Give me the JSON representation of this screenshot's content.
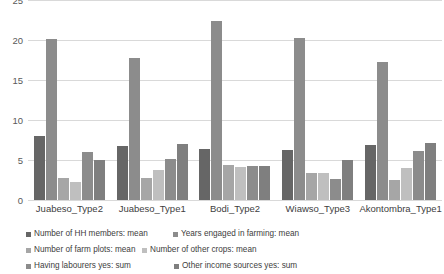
{
  "chart_data": {
    "type": "bar",
    "title": "",
    "subtitle": "",
    "xlabel": "",
    "ylabel": "",
    "ylim": [
      0,
      25
    ],
    "yticks": [
      0,
      5,
      10,
      15,
      20,
      25
    ],
    "grid": true,
    "legend_position": "bottom",
    "categories": [
      "Juabeso_Type2",
      "Juabeso_Type1",
      "Bodi_Type2",
      "Wiawso_Type3",
      "Akontombra_Type1"
    ],
    "series": [
      {
        "name": "Number of HH members: mean",
        "color": "#666666",
        "values": [
          8.0,
          6.8,
          6.4,
          6.2,
          6.9
        ]
      },
      {
        "name": "Years engaged in farming: mean",
        "color": "#8c8c8c",
        "values": [
          20.1,
          17.8,
          22.4,
          20.2,
          17.2
        ]
      },
      {
        "name": "Number of farm plots: mean",
        "color": "#a6a6a6",
        "values": [
          2.8,
          2.7,
          4.4,
          3.4,
          2.5
        ]
      },
      {
        "name": "Number of other crops: mean",
        "color": "#bfbfbf",
        "values": [
          2.3,
          3.7,
          4.1,
          3.4,
          4.0
        ]
      },
      {
        "name": "Having  labourers yes: sum",
        "color": "#8c8c8c",
        "values": [
          6.0,
          5.1,
          4.3,
          2.6,
          6.1
        ]
      },
      {
        "name": "Other income sources yes: sum",
        "color": "#7f7f7f",
        "values": [
          5.0,
          7.0,
          4.3,
          5.0,
          7.1
        ]
      }
    ]
  },
  "axis": {
    "y_tick_labels": [
      "0",
      "5",
      "10",
      "15",
      "20",
      "25"
    ]
  },
  "colors": {
    "gridline": "#d9d9d9",
    "tick_text": "#595959",
    "label_text": "#404040",
    "background": "#ffffff"
  }
}
